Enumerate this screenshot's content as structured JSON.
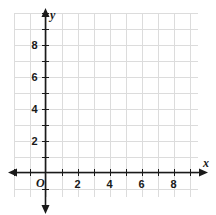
{
  "chart_data": {
    "type": "scatter",
    "title": "",
    "xlabel": "x",
    "ylabel": "y",
    "series": [],
    "x": [],
    "values": [],
    "xlim": [
      -2,
      9.5
    ],
    "ylim": [
      -1.5,
      10
    ],
    "xticks": [
      2,
      4,
      6,
      8
    ],
    "yticks": [
      2,
      4,
      6,
      8
    ],
    "xtick_labels": [
      "2",
      "4",
      "6",
      "8"
    ],
    "ytick_labels": [
      "2",
      "4",
      "6",
      "8"
    ],
    "grid": true,
    "grid_step": 1,
    "legend": "none",
    "origin_label": "O",
    "annotations": []
  },
  "axes": {
    "x_axis_name": "x",
    "y_axis_name": "y",
    "origin_label": "O"
  },
  "colors": {
    "grid": "#dcdcdc",
    "axis": "#1a1a1a",
    "background": "#ffffff",
    "text": "#1a1a1a"
  }
}
